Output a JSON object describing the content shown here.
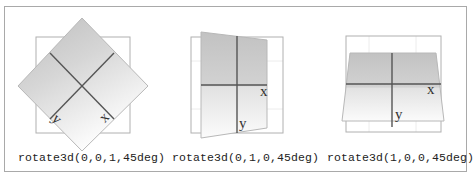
{
  "figures": [
    {
      "id": "z-axis",
      "caption": "rotate3d(0,0,1,45deg)",
      "axis_x_label": "x",
      "axis_y_label": "y"
    },
    {
      "id": "y-axis",
      "caption": "rotate3d(0,1,0,45deg)",
      "axis_x_label": "x",
      "axis_y_label": "y"
    },
    {
      "id": "x-axis",
      "caption": "rotate3d(1,0,0,45deg)",
      "axis_x_label": "x",
      "axis_y_label": "y"
    }
  ],
  "colors": {
    "frame_border": "#a9a9a9",
    "reference_square": "#b0b0b0",
    "grid": "#e4e4e4",
    "fill_dark": "#c4c4c4",
    "fill_light": "#fafafa",
    "axis": "#555555"
  }
}
